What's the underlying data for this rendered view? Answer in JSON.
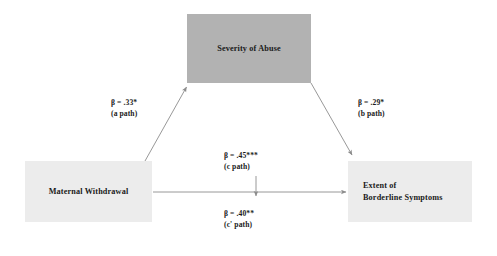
{
  "figure": {
    "type": "mediation-path-diagram",
    "width": 497,
    "height": 256,
    "background_color": "#ffffff"
  },
  "nodes": {
    "mediator": {
      "label": "Severity of Abuse",
      "role": "mediator",
      "fill_color": "#b2b2b2",
      "text_color": "#1a1a1a"
    },
    "predictor": {
      "label": "Maternal Withdrawal",
      "role": "independent-variable",
      "fill_color": "#ececec",
      "text_color": "#1a1a1a"
    },
    "outcome": {
      "role": "dependent-variable",
      "line1": "Extent of",
      "line2": "Borderline Symptoms",
      "fill_color": "#ececec",
      "text_color": "#1a1a1a"
    }
  },
  "paths": {
    "a": {
      "coefficient": "β = .33*",
      "name": "(a path)",
      "from": "predictor",
      "to": "mediator"
    },
    "b": {
      "coefficient": "β = .29*",
      "name": "(b path)",
      "from": "mediator",
      "to": "outcome"
    },
    "c": {
      "coefficient": "β = .45***",
      "name": "(c path)",
      "from": "predictor",
      "to": "outcome"
    },
    "c_prime": {
      "coefficient": "β = .40**",
      "name": "(c' path)",
      "from": "predictor",
      "to": "outcome"
    }
  },
  "style": {
    "arrow_color": "#8c8c8c",
    "arrow_width": 0.9
  }
}
